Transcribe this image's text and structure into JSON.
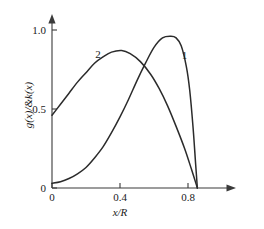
{
  "chart_data": {
    "type": "line",
    "title": "",
    "subtitle": "",
    "xlabel": "x/R",
    "ylabel": "g(x)/&k(x)",
    "xlim": [
      0,
      0.92
    ],
    "ylim": [
      0,
      1.05
    ],
    "grid": false,
    "legend_position": "inline-curve-labels",
    "xticks": [
      0,
      0.4,
      0.8
    ],
    "xticklabels": [
      "0",
      "0.4",
      "0.8"
    ],
    "yticks": [
      0,
      0.5,
      1.0
    ],
    "yticklabels": [
      "0",
      "0.5",
      "1.0"
    ],
    "annotations": [
      {
        "text": "1",
        "x": 0.78,
        "y": 0.84
      },
      {
        "text": "2",
        "x": 0.27,
        "y": 0.85
      }
    ],
    "series": [
      {
        "name": "1",
        "label": "1",
        "color": "#2b2b2b",
        "x": [
          0.0,
          0.05,
          0.1,
          0.15,
          0.2,
          0.25,
          0.3,
          0.35,
          0.4,
          0.45,
          0.5,
          0.55,
          0.6,
          0.65,
          0.7,
          0.73,
          0.76,
          0.79,
          0.81,
          0.83,
          0.845,
          0.855
        ],
        "values": [
          0.03,
          0.04,
          0.06,
          0.09,
          0.13,
          0.19,
          0.26,
          0.35,
          0.45,
          0.56,
          0.68,
          0.79,
          0.89,
          0.95,
          0.96,
          0.95,
          0.9,
          0.77,
          0.62,
          0.38,
          0.15,
          0.0
        ]
      },
      {
        "name": "2",
        "label": "2",
        "color": "#2b2b2b",
        "x": [
          0.0,
          0.05,
          0.1,
          0.15,
          0.2,
          0.25,
          0.3,
          0.35,
          0.41,
          0.46,
          0.52,
          0.58,
          0.63,
          0.68,
          0.73,
          0.78,
          0.82,
          0.855
        ],
        "values": [
          0.46,
          0.53,
          0.6,
          0.67,
          0.73,
          0.79,
          0.83,
          0.86,
          0.87,
          0.85,
          0.8,
          0.72,
          0.63,
          0.52,
          0.39,
          0.25,
          0.12,
          0.0
        ]
      }
    ]
  },
  "axis": {
    "x_title": "x/R",
    "y_title": "g(x)/&k(x)",
    "x_tick_0": "0",
    "x_tick_1": "0.4",
    "x_tick_2": "0.8",
    "y_tick_0": "0",
    "y_tick_1": "0.5",
    "y_tick_2": "1.0"
  },
  "labels": {
    "curve_one": "1",
    "curve_two": "2"
  },
  "colors": {
    "curve": "#2b2b2b",
    "axis": "#3a3a3a",
    "background": "#ffffff"
  }
}
